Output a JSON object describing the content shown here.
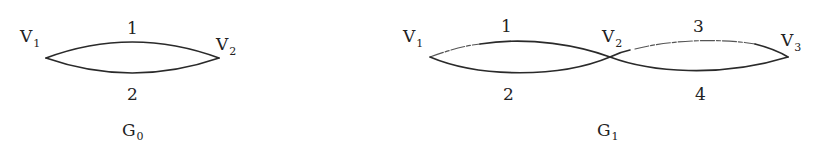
{
  "graphs": [
    {
      "name": "G",
      "subscript": "0",
      "vertices": [
        {
          "label": "V",
          "subscript": "1"
        },
        {
          "label": "V",
          "subscript": "2"
        }
      ],
      "edges": [
        {
          "label": "1",
          "from": "V1",
          "to": "V2"
        },
        {
          "label": "2",
          "from": "V1",
          "to": "V2"
        }
      ]
    },
    {
      "name": "G",
      "subscript": "1",
      "vertices": [
        {
          "label": "V",
          "subscript": "1"
        },
        {
          "label": "V",
          "subscript": "2"
        },
        {
          "label": "V",
          "subscript": "3"
        }
      ],
      "edges": [
        {
          "label": "1",
          "from": "V1",
          "to": "V3"
        },
        {
          "label": "2",
          "from": "V1",
          "to": "V2"
        },
        {
          "label": "3",
          "from": "V2",
          "to": "V3"
        },
        {
          "label": "4",
          "from": "V2",
          "to": "V3"
        }
      ]
    }
  ]
}
